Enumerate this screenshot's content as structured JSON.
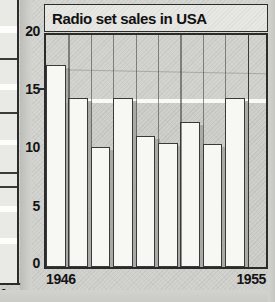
{
  "chart_data": {
    "type": "bar",
    "title": "Radio set sales in USA",
    "xlabel": "",
    "ylabel": "Millions",
    "categories": [
      "1946",
      "1947",
      "1948",
      "1949",
      "1950",
      "1951",
      "1952",
      "1953",
      "1954",
      "1955"
    ],
    "x_tick_labels_shown": [
      "1946",
      "1955"
    ],
    "values": [
      17.1,
      14.3,
      10.2,
      14.3,
      11.1,
      10.5,
      12.3,
      10.4,
      14.3,
      0
    ],
    "ylim": [
      0,
      20
    ],
    "y_ticks": [
      0,
      5,
      10,
      15,
      20
    ],
    "y_tick_labels": [
      "0",
      "5",
      "10",
      "15",
      "20"
    ],
    "grid": false,
    "legend": "none",
    "bar_count": 10,
    "annotations": [
      "faint diagonal hairline across upper plot",
      "white horizontal highlight band near value 15"
    ]
  },
  "colors": {
    "bar_fill": "#f7f7f3",
    "bar_outline": "#3a3a3a",
    "bar_shadow": "#9d9d99",
    "plot_background": "#cfcfcb",
    "paper": "#d6d6d3",
    "ink": "#141414",
    "highlight_band": "#fbfbf7"
  },
  "left_fragment": {
    "zero_label": "0"
  }
}
